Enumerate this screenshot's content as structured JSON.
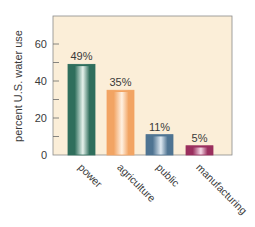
{
  "chart_data": {
    "type": "bar",
    "title": "",
    "xlabel": "",
    "ylabel": "percent U.S. water use",
    "categories": [
      "power",
      "agriculture",
      "public",
      "manufacturing"
    ],
    "values": [
      49,
      35,
      11,
      5
    ],
    "data_labels": [
      "49%",
      "35%",
      "11%",
      "5%"
    ],
    "ylim": [
      0,
      75
    ],
    "yticks": [
      0,
      20,
      40,
      60
    ],
    "yticks_minor": [
      10,
      30,
      50
    ],
    "grid": false,
    "legend": "none",
    "colors": {
      "plot_background": "#fbeed8",
      "frame": "#8a8a8a",
      "bars": [
        {
          "dark": "#2f6e5c",
          "light": "#e6f2ec"
        },
        {
          "dark": "#f2a463",
          "light": "#fff1e2"
        },
        {
          "dark": "#4f7492",
          "light": "#dfe9f1"
        },
        {
          "dark": "#9a2f5e",
          "light": "#f4d9e6"
        }
      ]
    }
  }
}
